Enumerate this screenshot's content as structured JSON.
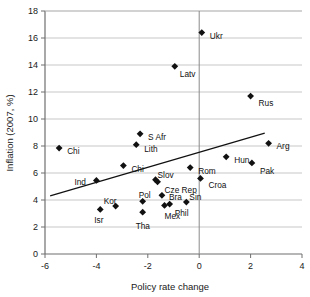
{
  "chart_data": {
    "type": "scatter",
    "title": "",
    "xlabel": "Policy rate change",
    "ylabel": "Inflation (2007, %)",
    "xlim": [
      -6,
      4
    ],
    "ylim": [
      0,
      18
    ],
    "xticks": [
      -6,
      -4,
      -2,
      0,
      2,
      4
    ],
    "yticks": [
      0,
      2,
      4,
      6,
      8,
      10,
      12,
      14,
      16,
      18
    ],
    "xtick_labels": [
      "-6",
      "-4",
      "-2",
      "0",
      "2",
      "4"
    ],
    "ytick_labels": [
      "0",
      "2",
      "4",
      "6",
      "8",
      "10",
      "12",
      "14",
      "16",
      "18"
    ],
    "grid": "horizontal",
    "legend": "none",
    "marker_style": "filled-diamond",
    "marker_color": "#111111",
    "points": [
      {
        "name": "Ukr",
        "x": 0.1,
        "y": 16.4,
        "lx": 8,
        "ly": 3
      },
      {
        "name": "Latv",
        "x": -0.95,
        "y": 13.9,
        "lx": 5,
        "ly": 8
      },
      {
        "name": "Rus",
        "x": 2.0,
        "y": 11.7,
        "lx": 8,
        "ly": 7
      },
      {
        "name": "S Afr",
        "x": -2.3,
        "y": 8.9,
        "lx": 8,
        "ly": 3
      },
      {
        "name": "Arg",
        "x": 2.7,
        "y": 8.2,
        "lx": 8,
        "ly": 3
      },
      {
        "name": "Lith",
        "x": -2.45,
        "y": 8.1,
        "lx": 8,
        "ly": 4
      },
      {
        "name": "Chi",
        "x": -5.45,
        "y": 7.85,
        "lx": 8,
        "ly": 3
      },
      {
        "name": "Hun",
        "x": 1.05,
        "y": 7.2,
        "lx": 8,
        "ly": 3
      },
      {
        "name": "Pak",
        "x": 2.05,
        "y": 6.75,
        "lx": 8,
        "ly": 8
      },
      {
        "name": "Chi",
        "x": -2.95,
        "y": 6.55,
        "lx": 8,
        "ly": 3
      },
      {
        "name": "Rom",
        "x": -0.35,
        "y": 6.4,
        "lx": 8,
        "ly": 3
      },
      {
        "name": "Croa",
        "x": 0.05,
        "y": 5.6,
        "lx": 8,
        "ly": 7
      },
      {
        "name": "Slov",
        "x": -1.7,
        "y": 5.5,
        "lx": 2,
        "ly": -5
      },
      {
        "name": "Cze Rep",
        "x": -1.62,
        "y": 5.35,
        "lx": 7,
        "ly": 8
      },
      {
        "name": "Ind",
        "x": -4.0,
        "y": 5.45,
        "lx": -22,
        "ly": 2
      },
      {
        "name": "Bra",
        "x": -1.45,
        "y": 4.35,
        "lx": 7,
        "ly": 2
      },
      {
        "name": "Pol",
        "x": -2.2,
        "y": 3.9,
        "lx": -4,
        "ly": -6
      },
      {
        "name": "Sin",
        "x": -0.5,
        "y": 3.85,
        "lx": 3,
        "ly": -5
      },
      {
        "name": "Phil",
        "x": -1.15,
        "y": 3.7,
        "lx": 5,
        "ly": 9
      },
      {
        "name": "Mex",
        "x": -1.35,
        "y": 3.6,
        "lx": 0,
        "ly": 11
      },
      {
        "name": "Kor",
        "x": -3.25,
        "y": 3.55,
        "lx": -12,
        "ly": -5
      },
      {
        "name": "Isr",
        "x": -3.85,
        "y": 3.3,
        "lx": -6,
        "ly": 11
      },
      {
        "name": "Tha",
        "x": -2.2,
        "y": 3.1,
        "lx": -7,
        "ly": 14
      }
    ],
    "trendline": {
      "x0": -5.8,
      "y0": 4.3,
      "x1": 2.55,
      "y1": 8.95
    }
  }
}
